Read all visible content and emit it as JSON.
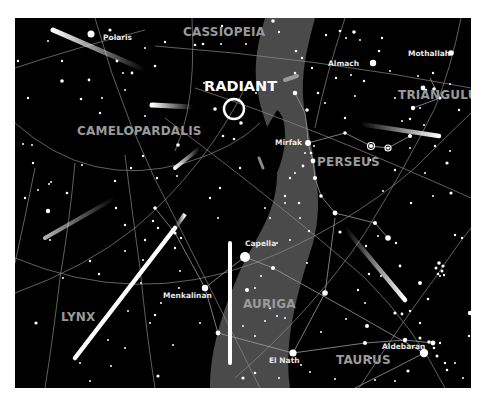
{
  "map": {
    "title": "Perseid meteor shower radiant",
    "radiant_label": "RADIANT",
    "colors": {
      "sky": "#000000",
      "milky_way": "#4a4a4a",
      "grid": "#8a8a8a",
      "constellation_label": "#9a9a9a",
      "star": "#ffffff"
    },
    "constellations": [
      {
        "name": "CASSIOPEIA",
        "x": 168,
        "y": 18
      },
      {
        "name": "CAMELOPARDALIS",
        "x": 62,
        "y": 117
      },
      {
        "name": "TRIANGULUM",
        "x": 383,
        "y": 81
      },
      {
        "name": "PERSEUS",
        "x": 302,
        "y": 148
      },
      {
        "name": "LYNX",
        "x": 46,
        "y": 303
      },
      {
        "name": "AURIGA",
        "x": 228,
        "y": 290
      },
      {
        "name": "TAURUS",
        "x": 321,
        "y": 346
      }
    ],
    "named_stars": [
      {
        "name": "Polaris",
        "label_x": 88,
        "label_y": 22,
        "x": 76,
        "y": 16,
        "r": 3.5
      },
      {
        "name": "Almach",
        "label_x": 313,
        "label_y": 48,
        "x": 358,
        "y": 45,
        "r": 3.2
      },
      {
        "name": "Mothallah",
        "label_x": 393,
        "label_y": 38,
        "x": 436,
        "y": 35,
        "r": 2.8
      },
      {
        "name": "Mirfak",
        "label_x": 260,
        "label_y": 127,
        "x": 293,
        "y": 125,
        "r": 3.0
      },
      {
        "name": "Capella",
        "label_x": 230,
        "label_y": 228,
        "x": 230,
        "y": 239,
        "r": 5.0
      },
      {
        "name": "Menkalinan",
        "label_x": 148,
        "label_y": 280,
        "x": 190,
        "y": 270,
        "r": 3.2
      },
      {
        "name": "El Nath",
        "label_x": 254,
        "label_y": 345,
        "x": 278,
        "y": 335,
        "r": 3.6
      },
      {
        "name": "Aldebaran",
        "label_x": 367,
        "label_y": 331,
        "x": 409,
        "y": 335,
        "r": 4.2
      }
    ],
    "radiant": {
      "x": 219,
      "y": 91,
      "r": 10
    }
  }
}
